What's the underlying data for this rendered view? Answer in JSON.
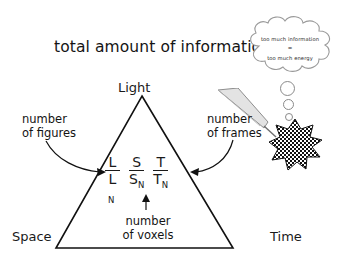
{
  "figure": {
    "title": "total amount of information",
    "background_color": "#ffffff",
    "ink_color": "#1a1a1a"
  },
  "thought_bubble": {
    "name": "thought-bubble",
    "line_1": "too much information",
    "equals": "=",
    "line_2": "too much energy",
    "dot_count": 3
  },
  "triangle": {
    "apex_label": "Light",
    "bottom_left_label": "Space",
    "bottom_right_label": "Time"
  },
  "annotations": {
    "left": {
      "line_1": "number",
      "line_2": "of figures"
    },
    "right": {
      "line_1": "number",
      "line_2": "of frames"
    },
    "bottom": {
      "line_1": "number",
      "line_2": "of voxels"
    }
  },
  "formula": {
    "terms": [
      {
        "numerator": "L",
        "denominator": "L",
        "subscript": "N"
      },
      {
        "numerator": "S",
        "denominator": "S",
        "subscript": "N"
      },
      {
        "numerator": "T",
        "denominator": "T",
        "subscript": "N"
      }
    ]
  },
  "icons": {
    "scalpel": "scalpel-icon",
    "blob": "checkered-blob-icon",
    "up_arrow": "up-arrow-icon"
  }
}
